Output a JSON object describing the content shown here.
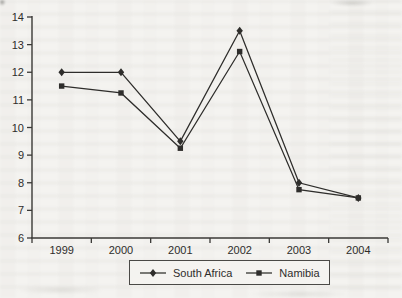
{
  "colors": {
    "line": "#2e2d2b",
    "axis": "#3a3936",
    "text": "#2e2d2b",
    "background": "#f4f3f0"
  },
  "chart_data": {
    "type": "line",
    "title": "",
    "xlabel": "",
    "ylabel": "",
    "categories": [
      "1999",
      "2000",
      "2001",
      "2002",
      "2003",
      "2004"
    ],
    "series": [
      {
        "name": "South Africa",
        "marker": "diamond",
        "values": [
          12.0,
          12.0,
          9.5,
          13.5,
          8.0,
          7.45
        ]
      },
      {
        "name": "Namibia",
        "marker": "square",
        "values": [
          11.5,
          11.25,
          9.25,
          12.75,
          7.75,
          7.45
        ]
      }
    ],
    "ylim": [
      6,
      14
    ],
    "yticks": [
      6,
      7,
      8,
      9,
      10,
      11,
      12,
      13,
      14
    ],
    "grid": false,
    "legend_position": "bottom"
  }
}
